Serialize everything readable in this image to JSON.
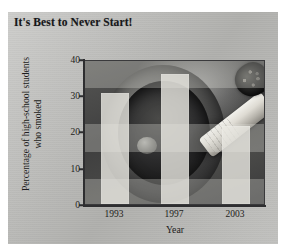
{
  "chart_data": {
    "type": "bar",
    "title": "It's Best to Never Start!",
    "xlabel": "Year",
    "ylabel": "Percentage of high-school students who smoked",
    "ylabel_line1": "Percentage of high-school students",
    "ylabel_line2": "who smoked",
    "categories": [
      "1993",
      "1997",
      "2003"
    ],
    "values": [
      30.5,
      36.0,
      21.5
    ],
    "ylim": [
      0,
      40
    ],
    "yticks": [
      0,
      10,
      20,
      30,
      40
    ],
    "ytick_labels": [
      "0",
      "10",
      "20",
      "30",
      "40"
    ],
    "grid": false,
    "legend": "none",
    "series": [
      {
        "name": "Percentage of high-school students who smoked",
        "values": [
          30.5,
          36.0,
          21.5
        ]
      }
    ],
    "background_image": "photograph of a dark ashtray with a lit cigarette",
    "colors": {
      "bar_fill": "#eae9e2",
      "axis": "#2e2e30",
      "text": "#1d1d20",
      "card_background": "#b9b9b6"
    }
  }
}
